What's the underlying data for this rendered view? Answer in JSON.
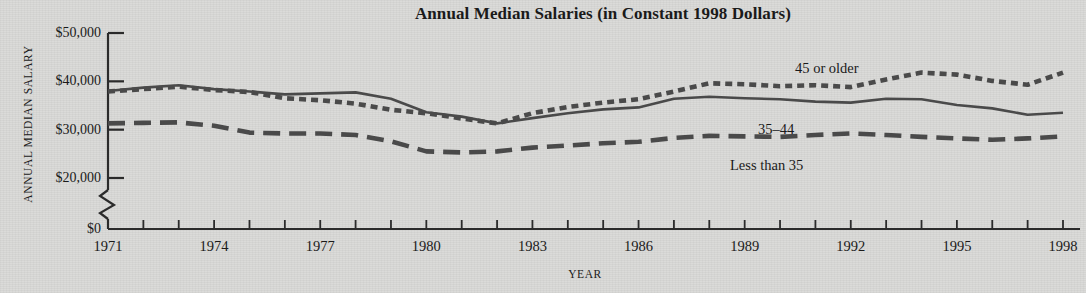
{
  "chart_data": {
    "type": "line",
    "title": "Annual Median Salaries (in Constant 1998 Dollars)",
    "xlabel": "YEAR",
    "ylabel": "ANNUAL MEDIAN SALARY",
    "grid": false,
    "legend_position": "inline-annotations",
    "xlim": [
      1971,
      1998
    ],
    "ylim": [
      20000,
      50000
    ],
    "y_axis_break": true,
    "y_axis_break_note": "axis broken between $0 and $20,000",
    "yticks": [
      0,
      20000,
      30000,
      40000,
      50000
    ],
    "ytick_labels": [
      "$0",
      "$20,000",
      "$30,000",
      "$40,000",
      "$50,000"
    ],
    "xticks": [
      1971,
      1972,
      1973,
      1974,
      1975,
      1976,
      1977,
      1978,
      1979,
      1980,
      1981,
      1982,
      1983,
      1984,
      1985,
      1986,
      1987,
      1988,
      1989,
      1990,
      1991,
      1992,
      1993,
      1994,
      1995,
      1996,
      1997,
      1998
    ],
    "xtick_labels": [
      "1971",
      "1974",
      "1977",
      "1980",
      "1983",
      "1986",
      "1989",
      "1992",
      "1995",
      "1998"
    ],
    "xtick_labeled_years": [
      1971,
      1974,
      1977,
      1980,
      1983,
      1986,
      1989,
      1992,
      1995,
      1998
    ],
    "x": [
      1971,
      1972,
      1973,
      1974,
      1975,
      1976,
      1977,
      1978,
      1979,
      1980,
      1981,
      1982,
      1983,
      1984,
      1985,
      1986,
      1987,
      1988,
      1989,
      1990,
      1991,
      1992,
      1993,
      1994,
      1995,
      1996,
      1997,
      1998
    ],
    "series": [
      {
        "name": "45 or older",
        "style": "dotted",
        "color": "#4a4a4a",
        "values": [
          37900,
          38400,
          38900,
          38200,
          37800,
          36500,
          36100,
          35400,
          34100,
          33400,
          32300,
          31300,
          33400,
          34700,
          35600,
          36300,
          37900,
          39600,
          39400,
          39000,
          39200,
          38800,
          40400,
          41800,
          41400,
          40100,
          39300,
          41800
        ]
      },
      {
        "name": "35-44",
        "style": "solid",
        "color": "#4a4a4a",
        "values": [
          38000,
          38700,
          39200,
          38400,
          37900,
          37300,
          37500,
          37700,
          36400,
          33600,
          32700,
          31300,
          32400,
          33400,
          34200,
          34600,
          36400,
          36800,
          36500,
          36300,
          35800,
          35600,
          36400,
          36300,
          35100,
          34400,
          33100,
          33500
        ]
      },
      {
        "name": "Less than 35",
        "style": "dashed",
        "color": "#4a4a4a",
        "values": [
          31300,
          31400,
          31500,
          30800,
          29400,
          29200,
          29200,
          28900,
          27600,
          25500,
          25300,
          25500,
          26300,
          26700,
          27200,
          27500,
          28300,
          28700,
          28600,
          28500,
          28900,
          29200,
          28900,
          28500,
          28200,
          27900,
          28200,
          28600
        ]
      }
    ],
    "annotations": [
      {
        "text": "45 or older",
        "series": "45 or older",
        "x_px": 795,
        "y_px": 60
      },
      {
        "text": "35–44",
        "series": "35-44",
        "x_px": 758,
        "y_px": 121
      },
      {
        "text": "Less than 35",
        "series": "Less than 35",
        "x_px": 730,
        "y_px": 157
      }
    ]
  }
}
